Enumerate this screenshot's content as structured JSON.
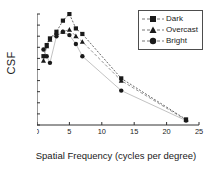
{
  "chart_data": {
    "type": "line",
    "title": "",
    "subtitle": "",
    "xlabel": "Spatial Frequency (cycles per degree)",
    "ylabel": "CSF",
    "xlim": [
      0,
      25
    ],
    "ylim": [
      0.0,
      1.0
    ],
    "xticks": [
      0,
      5,
      10,
      15,
      20,
      25
    ],
    "xtick_labels": [
      "0",
      "5",
      "10",
      "15",
      "20",
      "25"
    ],
    "yticks": [
      0.0,
      0.1,
      0.2,
      0.3,
      0.4,
      0.5,
      0.6,
      0.7,
      0.8,
      0.9,
      1.0
    ],
    "ytick_labels": [
      "0.0",
      "0.1",
      "0.2",
      "0.3",
      "0.4",
      "0.5",
      "0.6",
      "0.7",
      "0.8",
      "0.9",
      "1.0"
    ],
    "grid": false,
    "legend_position": "top-right",
    "x": [
      1,
      1.5,
      2,
      3,
      4,
      5,
      6,
      7,
      13,
      23
    ],
    "series": [
      {
        "name": "Dark",
        "marker": "square",
        "color": "#1a1a1a",
        "linestyle": "dotted",
        "values": [
          0.62,
          0.72,
          0.78,
          0.84,
          0.94,
          1.0,
          0.87,
          0.82,
          0.42,
          0.05
        ]
      },
      {
        "name": "Overcast",
        "marker": "triangle",
        "color": "#1a1a1a",
        "linestyle": "dashed",
        "values": [
          0.58,
          0.71,
          0.77,
          0.83,
          0.84,
          0.86,
          0.8,
          0.75,
          0.4,
          0.045
        ]
      },
      {
        "name": "Bright",
        "marker": "circle",
        "color": "#1a1a1a",
        "linestyle": "solid",
        "values": [
          0.68,
          0.62,
          0.56,
          0.8,
          0.84,
          0.81,
          0.73,
          0.62,
          0.31,
          0.04
        ]
      }
    ]
  },
  "legend": {
    "items": [
      {
        "label": "Dark",
        "marker": "square-marker"
      },
      {
        "label": "Overcast",
        "marker": "triangle-marker"
      },
      {
        "label": "Bright",
        "marker": "circle-marker"
      }
    ]
  },
  "axis": {
    "y_title": "CSF",
    "x_title": "Spatial Frequency (cycles per degree)"
  },
  "colors": {
    "axis": "#333333",
    "marker": "#1a1a1a",
    "line_dark": "#555555",
    "line_overcast": "#888888",
    "line_bright": "#bbbbbb",
    "background": "#ffffff"
  }
}
